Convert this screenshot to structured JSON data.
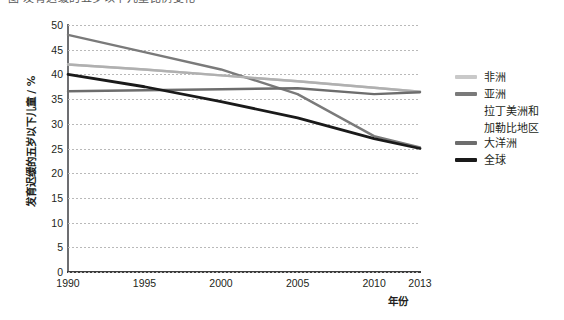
{
  "top_strip": {
    "text": "图 发育迟缓的五岁以下儿童比例变化"
  },
  "chart_data": {
    "type": "line",
    "title": "",
    "xlabel": "年份",
    "ylabel": "发育迟缓的五岁以下儿童 / %",
    "x": [
      1990,
      1995,
      2000,
      2005,
      2010,
      2013
    ],
    "xticklabels": [
      "1990",
      "1995",
      "2000",
      "2005",
      "2010",
      "2013"
    ],
    "yticklabels": [
      "0",
      "5",
      "10",
      "15",
      "20",
      "25",
      "30",
      "35",
      "40",
      "45",
      "50"
    ],
    "ylim": [
      0,
      50
    ],
    "ytick_step": 5,
    "xlim": [
      1990,
      2013
    ],
    "grid": true,
    "legend_position": "right",
    "series": [
      {
        "name": "非洲",
        "color": "#c9c9c9",
        "width": 2.4,
        "values": [
          42.0,
          41.0,
          39.8,
          38.6,
          37.3,
          36.5
        ]
      },
      {
        "name": "亚洲",
        "color": "#7a7a7a",
        "width": 2.4,
        "values": [
          48.0,
          44.5,
          41.0,
          36.0,
          27.5,
          25.2
        ]
      },
      {
        "name": "拉丁美洲和加勒比地区",
        "color": "#b0b0b0",
        "width": 2.4,
        "values": [
          42.0,
          41.0,
          39.8,
          38.6,
          37.3,
          36.5
        ]
      },
      {
        "name": "大洋洲",
        "color": "#6d6d6d",
        "width": 2.4,
        "values": [
          36.6,
          36.8,
          37.0,
          37.2,
          36.0,
          36.4
        ]
      },
      {
        "name": "全球",
        "color": "#1a1a1a",
        "width": 2.8,
        "values": [
          40.0,
          37.5,
          34.5,
          31.2,
          27.0,
          25.0
        ]
      }
    ],
    "legend_entries": [
      {
        "label": "非洲",
        "color": "#c9c9c9",
        "swatch": true,
        "continuation": ""
      },
      {
        "label": "亚洲",
        "color": "#7a7a7a",
        "swatch": true,
        "continuation": ""
      },
      {
        "label": "拉丁美洲和",
        "color": "#b0b0b0",
        "swatch": false,
        "continuation": "加勒比地区"
      },
      {
        "label": "大洋洲",
        "color": "#6d6d6d",
        "swatch": true,
        "continuation": ""
      },
      {
        "label": "全球",
        "color": "#1a1a1a",
        "swatch": true,
        "continuation": ""
      }
    ]
  }
}
